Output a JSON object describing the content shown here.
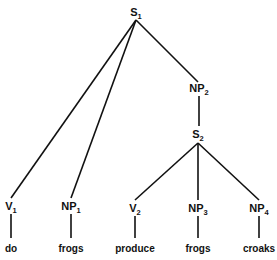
{
  "tree": {
    "nodes": [
      {
        "id": "S1",
        "label": "S",
        "sub": "1",
        "x": 136,
        "y": 16
      },
      {
        "id": "NP2",
        "label": "NP",
        "sub": "2",
        "x": 199,
        "y": 92
      },
      {
        "id": "S2",
        "label": "S",
        "sub": "2",
        "x": 198,
        "y": 138
      },
      {
        "id": "V1",
        "label": "V",
        "sub": "1",
        "x": 11,
        "y": 210
      },
      {
        "id": "NP1",
        "label": "NP",
        "sub": "1",
        "x": 71,
        "y": 210
      },
      {
        "id": "V2",
        "label": "V",
        "sub": "2",
        "x": 135,
        "y": 212
      },
      {
        "id": "NP3",
        "label": "NP",
        "sub": "3",
        "x": 198,
        "y": 212
      },
      {
        "id": "NP4",
        "label": "NP",
        "sub": "4",
        "x": 259,
        "y": 212
      }
    ],
    "words": [
      {
        "text": "do",
        "x": 11,
        "y": 252
      },
      {
        "text": "frogs",
        "x": 71,
        "y": 252
      },
      {
        "text": "produce",
        "x": 135,
        "y": 252
      },
      {
        "text": "frogs",
        "x": 198,
        "y": 252
      },
      {
        "text": "croaks",
        "x": 259,
        "y": 252
      }
    ],
    "edges": [
      [
        136,
        20,
        11,
        198
      ],
      [
        136,
        20,
        71,
        198
      ],
      [
        136,
        20,
        198,
        82
      ],
      [
        199,
        96,
        199,
        126
      ],
      [
        198,
        143,
        135,
        200
      ],
      [
        198,
        143,
        198,
        200
      ],
      [
        198,
        143,
        259,
        200
      ],
      [
        11,
        214,
        11,
        238
      ],
      [
        71,
        214,
        71,
        238
      ],
      [
        135,
        216,
        135,
        238
      ],
      [
        198,
        216,
        198,
        238
      ],
      [
        259,
        216,
        259,
        238
      ]
    ]
  }
}
